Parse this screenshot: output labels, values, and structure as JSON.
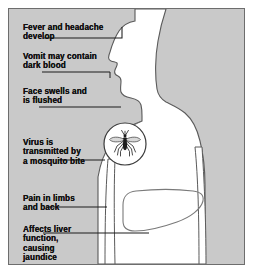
{
  "diagram": {
    "panel": {
      "background_color": "#c9c9c9",
      "border_color": "#6d6d6d",
      "body_fill_color": "#ffffff",
      "outline_color": "#4a4a4a",
      "text_color": "#111111"
    },
    "figure": {
      "subject": "human-head-and-torso-profile",
      "facing": "left",
      "fill": "#ffffff"
    },
    "inset": {
      "name": "mosquito-inset",
      "shape": "circle",
      "contents": "mosquito",
      "fill": "#ffffff"
    },
    "organ": {
      "name": "liver",
      "shape": "outline",
      "fill": "none"
    },
    "labels": [
      {
        "id": "fever",
        "text": "Fever and headache\ndevelop",
        "target": "forehead",
        "leader": "elbow-up"
      },
      {
        "id": "vomit",
        "text": "Vomit may contain\ndark blood",
        "target": "mouth",
        "leader": "straight-tick"
      },
      {
        "id": "face",
        "text": "Face swells and\nis flushed",
        "target": "cheek-jaw",
        "leader": "straight"
      },
      {
        "id": "virus",
        "text": "Virus is\ntransmitted by\na mosquito bite",
        "target": "mosquito-inset",
        "leader": "straight"
      },
      {
        "id": "pain",
        "text": "Pain in limbs\nand back",
        "target": "arm",
        "leader": "straight"
      },
      {
        "id": "liver",
        "text": "Affects liver\nfunction,\ncausing\njaundice",
        "target": "liver",
        "leader": "straight"
      }
    ]
  }
}
